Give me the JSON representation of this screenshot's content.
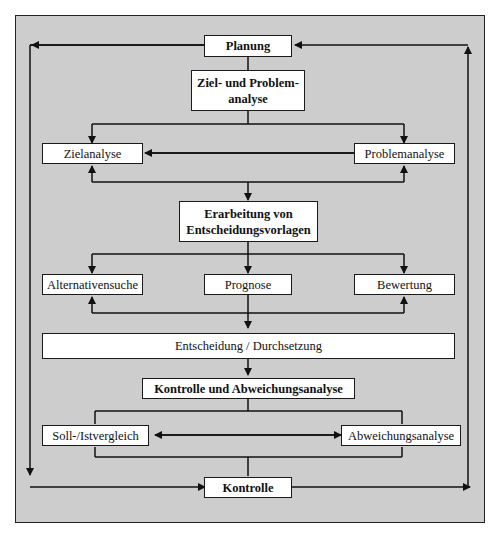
{
  "diagram": {
    "type": "flowchart",
    "background_color": "#cdcdcd",
    "box_color": "#ffffff",
    "line_color": "#111111",
    "nodes": {
      "planung": "Planung",
      "ziel_problem_line1": "Ziel- und Problem-",
      "ziel_problem_line2": "analyse",
      "zielanalyse": "Zielanalyse",
      "problemanalyse": "Problemanalyse",
      "erarbeitung_line1": "Erarbeitung von",
      "erarbeitung_line2": "Entscheidungsvorlagen",
      "alternativensuche": "Alternativensuche",
      "prognose": "Prognose",
      "bewertung": "Bewertung",
      "entscheidung": "Entscheidung / Durchsetzung",
      "kontrolle_abweichung": "Kontrolle und Abweichungsanalyse",
      "soll_ist": "Soll-/Istvergleich",
      "abweichungsanalyse": "Abweichungsanalyse",
      "kontrolle": "Kontrolle"
    },
    "edges": [
      [
        "Planung",
        "Ziel- und Problemanalyse"
      ],
      [
        "Ziel- und Problemanalyse",
        "Zielanalyse"
      ],
      [
        "Ziel- und Problemanalyse",
        "Problemanalyse"
      ],
      [
        "Zielanalyse",
        "Problemanalyse",
        "bidirectional"
      ],
      [
        "Zielanalyse + Problemanalyse",
        "Erarbeitung von Entscheidungsvorlagen"
      ],
      [
        "Erarbeitung von Entscheidungsvorlagen",
        "Alternativensuche"
      ],
      [
        "Erarbeitung von Entscheidungsvorlagen",
        "Prognose"
      ],
      [
        "Erarbeitung von Entscheidungsvorlagen",
        "Bewertung"
      ],
      [
        "Prognose",
        "Alternativensuche"
      ],
      [
        "Prognose",
        "Bewertung"
      ],
      [
        "Prognose",
        "Entscheidung / Durchsetzung"
      ],
      [
        "Entscheidung / Durchsetzung",
        "Kontrolle und Abweichungsanalyse"
      ],
      [
        "Soll-/Istvergleich",
        "Abweichungsanalyse",
        "bidirectional"
      ],
      [
        "Kontrolle und Abweichungsanalyse",
        "Kontrolle"
      ],
      [
        "Planung",
        "Kontrolle",
        "left loop"
      ],
      [
        "Kontrolle",
        "Planung",
        "right loop"
      ]
    ]
  }
}
